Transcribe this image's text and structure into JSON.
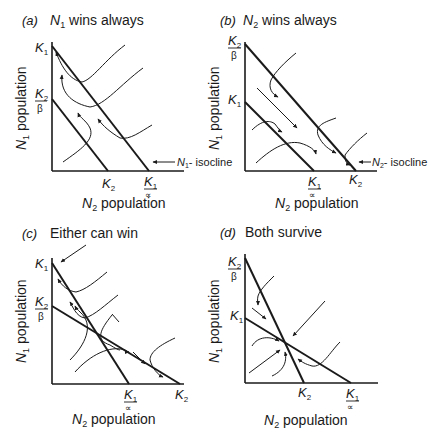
{
  "panels": [
    {
      "id": "a",
      "letter": "(a)",
      "title_var": "N",
      "title_sub": "1",
      "title_rest": " wins always",
      "ylabel_var": "N",
      "ylabel_sub": "1",
      "ylabel_rest": " population",
      "xlabel_var": "N",
      "xlabel_sub": "2",
      "xlabel_rest": " population",
      "y_ticks": [
        "K1",
        "K2/β"
      ],
      "x_ticks": [
        "K2",
        "K1/∝"
      ],
      "annotation": "N1-isocline"
    },
    {
      "id": "b",
      "letter": "(b)",
      "title_var": "N",
      "title_sub": "2",
      "title_rest": " wins always",
      "ylabel_var": "N",
      "ylabel_sub": "1",
      "ylabel_rest": " population",
      "xlabel_var": "N",
      "xlabel_sub": "2",
      "xlabel_rest": " population",
      "y_ticks": [
        "K2/β",
        "K1"
      ],
      "x_ticks": [
        "K1/∝",
        "K2"
      ],
      "annotation": "N2-isocline"
    },
    {
      "id": "c",
      "letter": "(c)",
      "title_var": "",
      "title_sub": "",
      "title_rest": "Either can win",
      "ylabel_var": "N",
      "ylabel_sub": "1",
      "ylabel_rest": " population",
      "xlabel_var": "N",
      "xlabel_sub": "2",
      "xlabel_rest": " population",
      "y_ticks": [
        "K1",
        "K2/β"
      ],
      "x_ticks": [
        "K1/∝",
        "K2"
      ]
    },
    {
      "id": "d",
      "letter": "(d)",
      "title_var": "",
      "title_sub": "",
      "title_rest": "Both survive",
      "ylabel_var": "N",
      "ylabel_sub": "1",
      "ylabel_rest": " population",
      "xlabel_var": "N",
      "xlabel_sub": "2",
      "xlabel_rest": " population",
      "y_ticks": [
        "K2/β",
        "K1"
      ],
      "x_ticks": [
        "K2",
        "K1/∝"
      ]
    }
  ],
  "symbols": {
    "K": "K",
    "one": "1",
    "two": "2",
    "beta": "β",
    "alpha": "∝",
    "isocline_suffix": "- isocline",
    "arrow_left": "←"
  },
  "colors": {
    "ink": "#1a1a1a",
    "background": "#ffffff"
  }
}
